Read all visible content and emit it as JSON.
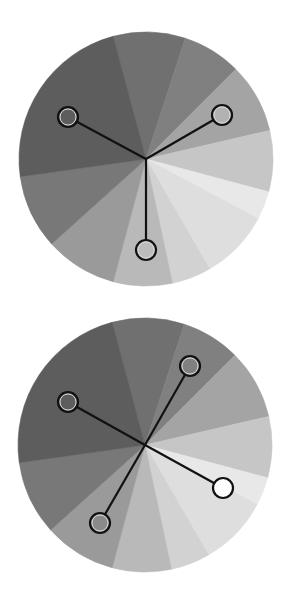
{
  "diagram": {
    "wedges": [
      {
        "from": -15,
        "to": 18,
        "color": "#707070"
      },
      {
        "from": 18,
        "to": 45,
        "color": "#808080"
      },
      {
        "from": 45,
        "to": 77,
        "color": "#a4a4a4"
      },
      {
        "from": 77,
        "to": 105,
        "color": "#c6c6c6"
      },
      {
        "from": 105,
        "to": 118,
        "color": "#e8e8e8"
      },
      {
        "from": 118,
        "to": 150,
        "color": "#dedede"
      },
      {
        "from": 150,
        "to": 168,
        "color": "#d2d2d2"
      },
      {
        "from": 168,
        "to": 195,
        "color": "#b9b9b9"
      },
      {
        "from": 195,
        "to": 228,
        "color": "#9a9a9a"
      },
      {
        "from": 228,
        "to": 262,
        "color": "#787878"
      },
      {
        "from": 262,
        "to": 345,
        "color": "#5d5d5d"
      }
    ],
    "wheels": [
      {
        "name": "triad",
        "center": [
          146,
          159
        ],
        "radius": 127,
        "markers": [
          {
            "x": 68,
            "y": 117,
            "fill": "#5d5d5d"
          },
          {
            "x": 222,
            "y": 115,
            "fill": "#b2b2b2"
          },
          {
            "x": 146,
            "y": 250,
            "fill": "#bcbcbc"
          }
        ]
      },
      {
        "name": "tetrad",
        "center": [
          145,
          445
        ],
        "radius": 127,
        "markers": [
          {
            "x": 68,
            "y": 402,
            "fill": "#5d5d5d"
          },
          {
            "x": 190,
            "y": 366,
            "fill": "#808080"
          },
          {
            "x": 223,
            "y": 488,
            "fill": "#ffffff"
          },
          {
            "x": 100,
            "y": 523,
            "fill": "#8a8a8a"
          }
        ]
      }
    ],
    "style": {
      "line_color": "#111111",
      "line_width": 2.2,
      "marker_radius": 10,
      "marker_inner_ring": "#d8d8d8"
    }
  }
}
